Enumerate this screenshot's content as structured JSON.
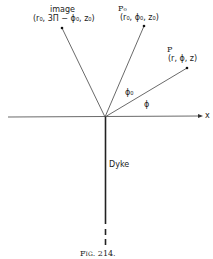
{
  "figure": {
    "caption": "Fig. 214.",
    "axis_label": "x",
    "dyke_label": "Dyke",
    "points": {
      "image": {
        "name": "image",
        "coords": "(r₀, 3Π − ϕ₀, z₀)"
      },
      "p0": {
        "name": "P₀",
        "coords": "(r₀, ϕ₀, z₀)"
      },
      "p": {
        "name": "P",
        "coords": "(r, ϕ, z)"
      }
    },
    "angles": {
      "phi0": "ϕ₀",
      "phi": "ϕ"
    }
  }
}
